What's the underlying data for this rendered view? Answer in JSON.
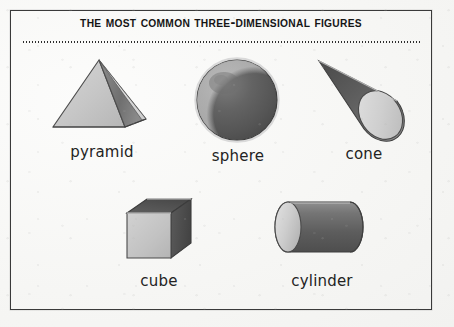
{
  "page": {
    "background_color": "#f6f6f4",
    "border_color": "#3a3a3a",
    "title": "The Most Common Three-dimensional Figures",
    "divider_style": "dotted"
  },
  "palette": {
    "paper": "#f6f6f4",
    "ink": "#151515",
    "outline": "#4a4a4a",
    "face_light": "#c9c9c9",
    "face_mid": "#9a9a9a",
    "face_dark": "#5c5c5c",
    "face_darker": "#454545",
    "sphere_fill": "#5a5a5a",
    "highlight": "#e4e4e4"
  },
  "figures": [
    {
      "id": "pyramid",
      "label": "pyramid",
      "icon": "pyramid-shape",
      "row": 1,
      "column": 1,
      "faces": [
        "front-left-light",
        "right-dark"
      ]
    },
    {
      "id": "sphere",
      "label": "sphere",
      "icon": "sphere-shape",
      "row": 1,
      "column": 2,
      "faces": [
        "radial-shaded"
      ]
    },
    {
      "id": "cone",
      "label": "cone",
      "icon": "cone-shape",
      "row": 1,
      "column": 3,
      "faces": [
        "lateral-dark",
        "base-ellipse-light"
      ]
    },
    {
      "id": "cube",
      "label": "cube",
      "icon": "cube-shape",
      "row": 2,
      "column": 1,
      "faces": [
        "front-light",
        "right-dark",
        "top-darker"
      ]
    },
    {
      "id": "cylinder",
      "label": "cylinder",
      "icon": "cylinder-shape",
      "row": 2,
      "column": 2,
      "faces": [
        "left-cap-light",
        "body-gradient"
      ]
    }
  ]
}
